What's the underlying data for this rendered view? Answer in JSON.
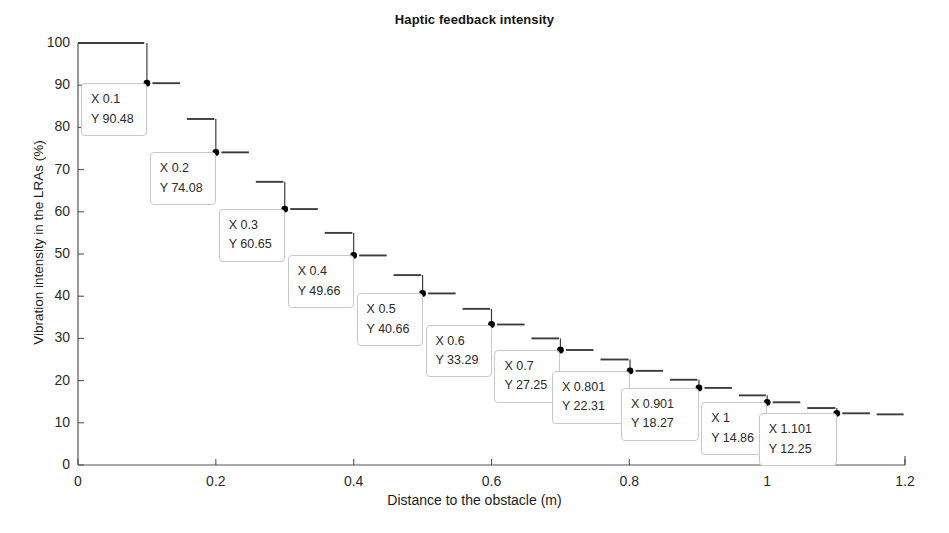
{
  "chart_data": {
    "type": "line",
    "title": "Haptic feedback intensity",
    "xlabel": "Distance to the obstacle (m)",
    "ylabel": "Vibration intensity in the LRAs (%)",
    "xlim": [
      0,
      1.2
    ],
    "ylim": [
      0,
      100
    ],
    "xticks": [
      "0",
      "0.2",
      "0.4",
      "0.6",
      "0.8",
      "1",
      "1.2"
    ],
    "xtick_values": [
      0,
      0.2,
      0.4,
      0.6,
      0.8,
      1,
      1.2
    ],
    "yticks": [
      "0",
      "10",
      "20",
      "30",
      "40",
      "50",
      "60",
      "70",
      "80",
      "90",
      "100"
    ],
    "ytick_values": [
      0,
      10,
      20,
      30,
      40,
      50,
      60,
      70,
      80,
      90,
      100
    ],
    "grid": false,
    "legend": null,
    "style": "staircase with dashed horizontal segments",
    "x": [
      0,
      0.05,
      0.1,
      0.15,
      0.2,
      0.25,
      0.3,
      0.35,
      0.4,
      0.45,
      0.5,
      0.55,
      0.6,
      0.65,
      0.7,
      0.75,
      0.801,
      0.851,
      0.901,
      0.951,
      1,
      1.05,
      1.101,
      1.151,
      1.2
    ],
    "values": [
      100,
      100,
      90.48,
      82,
      74.08,
      67.1,
      60.65,
      55,
      49.66,
      45,
      40.66,
      37,
      33.29,
      30,
      27.25,
      25,
      22.31,
      20.2,
      18.27,
      16.5,
      14.86,
      13.5,
      12.25,
      12,
      12
    ],
    "markers": [
      {
        "x": 0.1,
        "y": 90.48
      },
      {
        "x": 0.2,
        "y": 74.08
      },
      {
        "x": 0.3,
        "y": 60.65
      },
      {
        "x": 0.4,
        "y": 49.66
      },
      {
        "x": 0.5,
        "y": 40.66
      },
      {
        "x": 0.6,
        "y": 33.29
      },
      {
        "x": 0.7,
        "y": 27.25
      },
      {
        "x": 0.801,
        "y": 22.31
      },
      {
        "x": 0.901,
        "y": 18.27
      },
      {
        "x": 1,
        "y": 14.86
      },
      {
        "x": 1.101,
        "y": 12.25
      }
    ],
    "segments": [
      {
        "x0": 0,
        "x1": 0.1,
        "y": 100
      },
      {
        "x0": 0.1,
        "x1": 0.15,
        "y": 90.48
      },
      {
        "x0": 0.15,
        "x1": 0.2,
        "y": 82
      },
      {
        "x0": 0.2,
        "x1": 0.25,
        "y": 74.08
      },
      {
        "x0": 0.25,
        "x1": 0.3,
        "y": 67.1
      },
      {
        "x0": 0.3,
        "x1": 0.35,
        "y": 60.65
      },
      {
        "x0": 0.35,
        "x1": 0.4,
        "y": 55
      },
      {
        "x0": 0.4,
        "x1": 0.45,
        "y": 49.66
      },
      {
        "x0": 0.45,
        "x1": 0.5,
        "y": 45
      },
      {
        "x0": 0.5,
        "x1": 0.55,
        "y": 40.66
      },
      {
        "x0": 0.55,
        "x1": 0.6,
        "y": 37
      },
      {
        "x0": 0.6,
        "x1": 0.65,
        "y": 33.29
      },
      {
        "x0": 0.65,
        "x1": 0.7,
        "y": 30
      },
      {
        "x0": 0.7,
        "x1": 0.75,
        "y": 27.25
      },
      {
        "x0": 0.75,
        "x1": 0.801,
        "y": 25
      },
      {
        "x0": 0.801,
        "x1": 0.851,
        "y": 22.31
      },
      {
        "x0": 0.851,
        "x1": 0.901,
        "y": 20.2
      },
      {
        "x0": 0.901,
        "x1": 0.951,
        "y": 18.27
      },
      {
        "x0": 0.951,
        "x1": 1,
        "y": 16.5
      },
      {
        "x0": 1,
        "x1": 1.05,
        "y": 14.86
      },
      {
        "x0": 1.05,
        "x1": 1.101,
        "y": 13.5
      },
      {
        "x0": 1.101,
        "x1": 1.151,
        "y": 12.25
      },
      {
        "x0": 1.151,
        "x1": 1.2,
        "y": 12
      }
    ],
    "droplines": [
      {
        "x": 0.1,
        "y_top": 100,
        "y_bottom": 90.48
      },
      {
        "x": 0.2,
        "y_top": 82,
        "y_bottom": 74.08
      },
      {
        "x": 0.3,
        "y_top": 67.1,
        "y_bottom": 60.65
      },
      {
        "x": 0.4,
        "y_top": 55,
        "y_bottom": 49.66
      },
      {
        "x": 0.5,
        "y_top": 45,
        "y_bottom": 40.66
      },
      {
        "x": 0.6,
        "y_top": 37,
        "y_bottom": 33.29
      },
      {
        "x": 0.7,
        "y_top": 30,
        "y_bottom": 27.25
      },
      {
        "x": 0.801,
        "y_top": 25,
        "y_bottom": 22.31
      },
      {
        "x": 0.901,
        "y_top": 20.2,
        "y_bottom": 18.27
      },
      {
        "x": 1,
        "y_top": 16.5,
        "y_bottom": 14.86
      },
      {
        "x": 1.101,
        "y_top": 13.5,
        "y_bottom": 12.25
      }
    ],
    "datatips": [
      {
        "x_text": "X 0.1",
        "y_text": "Y 90.48",
        "anchor_x": 0.1,
        "anchor_y": 90.48
      },
      {
        "x_text": "X 0.2",
        "y_text": "Y 74.08",
        "anchor_x": 0.2,
        "anchor_y": 74.08
      },
      {
        "x_text": "X 0.3",
        "y_text": "Y 60.65",
        "anchor_x": 0.3,
        "anchor_y": 60.65
      },
      {
        "x_text": "X 0.4",
        "y_text": "Y 49.66",
        "anchor_x": 0.4,
        "anchor_y": 49.66
      },
      {
        "x_text": "X 0.5",
        "y_text": "Y 40.66",
        "anchor_x": 0.5,
        "anchor_y": 40.66
      },
      {
        "x_text": "X 0.6",
        "y_text": "Y 33.29",
        "anchor_x": 0.6,
        "anchor_y": 33.29
      },
      {
        "x_text": "X 0.7",
        "y_text": "Y 27.25",
        "anchor_x": 0.7,
        "anchor_y": 27.25
      },
      {
        "x_text": "X 0.801",
        "y_text": "Y 22.31",
        "anchor_x": 0.801,
        "anchor_y": 22.31
      },
      {
        "x_text": "X 0.901",
        "y_text": "Y 18.27",
        "anchor_x": 0.901,
        "anchor_y": 18.27
      },
      {
        "x_text": "X 1",
        "y_text": "Y 14.86",
        "anchor_x": 1,
        "anchor_y": 14.86
      },
      {
        "x_text": "X 1.101",
        "y_text": "Y 12.25",
        "anchor_x": 1.101,
        "anchor_y": 12.25
      }
    ],
    "colors": {
      "line": "#3d3d3d",
      "marker": "#000000",
      "axis": "#555555",
      "tip_border": "#c8c8c8",
      "tip_background": "#ffffff",
      "text": "#1b1b1b"
    }
  }
}
